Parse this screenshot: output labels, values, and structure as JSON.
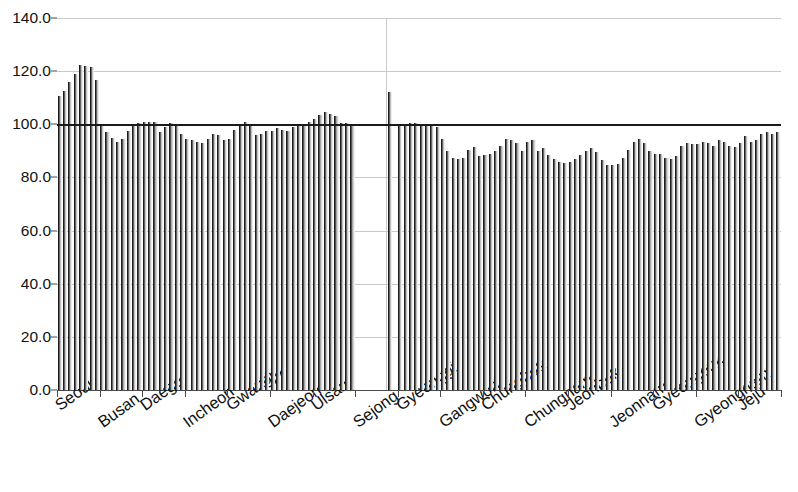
{
  "chart_data": {
    "type": "bar",
    "title": "",
    "subtitle": "",
    "xlabel": "",
    "ylabel": "",
    "ylim": [
      0.0,
      140.0
    ],
    "ytick_labels": [
      "0.0",
      "20.0",
      "40.0",
      "60.0",
      "80.0",
      "100.0",
      "120.0",
      "140.0"
    ],
    "ytick_values": [
      0.0,
      20.0,
      40.0,
      60.0,
      80.0,
      100.0,
      120.0,
      140.0
    ],
    "grid": "horizontal",
    "legend": "none",
    "reference_line": {
      "value": 100.0,
      "label": "100.0",
      "color": "#1a1a1a"
    },
    "bar_color": "#9a9a9a",
    "bar_edge_color": "#1c1c1c",
    "categories": [
      "Seoul",
      "Busan",
      "Daegu",
      "Incheon",
      "Gwangju",
      "Daejeon",
      "Ulsan",
      "Sejong",
      "Gyeonggi",
      "Gangwon",
      "Chungbuk",
      "Chungnam",
      "Jeonbuk",
      "Jeonnam",
      "Gyeongbuk",
      "Gyeongnam",
      "Jeju"
    ],
    "groups": [
      {
        "name": "Seoul",
        "values": [
          110.5,
          112.5,
          116.0,
          119.0,
          122.5,
          122.0,
          121.5,
          116.5
        ]
      },
      {
        "name": "Busan",
        "values": [
          99.5,
          97.0,
          95.0,
          93.5,
          94.5,
          97.5,
          99.5,
          100.5
        ]
      },
      {
        "name": "Daegu",
        "values": [
          101.0,
          101.0,
          101.0,
          97.0,
          99.0,
          100.5,
          99.5,
          96.5
        ]
      },
      {
        "name": "Incheon",
        "values": [
          94.5,
          94.0,
          93.5,
          93.0,
          94.5,
          96.5,
          96.0,
          94.0
        ]
      },
      {
        "name": "Gwangju",
        "values": [
          94.5,
          98.0,
          99.5,
          101.0,
          99.5,
          96.0,
          96.5,
          97.5
        ]
      },
      {
        "name": "Daejeon",
        "values": [
          97.5,
          98.5,
          98.0,
          97.5,
          99.0,
          99.5,
          100.0,
          101.0
        ]
      },
      {
        "name": "Ulsan",
        "values": [
          102.0,
          103.5,
          104.5,
          104.0,
          103.0,
          100.5,
          100.5,
          100.0
        ]
      },
      {
        "name": "Sejong",
        "values": [
          null,
          null,
          null,
          null,
          null,
          null,
          112.0,
          null
        ]
      },
      {
        "name": "Gyeonggi",
        "values": [
          99.5,
          100.0,
          100.5,
          100.5,
          100.0,
          99.5,
          99.5,
          99.0
        ]
      },
      {
        "name": "Gangwon",
        "values": [
          94.5,
          90.0,
          87.5,
          87.0,
          87.5,
          90.5,
          91.5,
          88.0
        ]
      },
      {
        "name": "Chungbuk",
        "values": [
          88.5,
          89.0,
          90.0,
          92.0,
          94.5,
          94.0,
          93.0,
          90.0
        ]
      },
      {
        "name": "Chungnam",
        "values": [
          93.5,
          94.0,
          90.0,
          91.0,
          88.5,
          87.0,
          86.0,
          85.5
        ]
      },
      {
        "name": "Jeonbuk",
        "values": [
          86.0,
          87.0,
          88.5,
          90.0,
          91.0,
          89.5,
          86.5,
          84.5
        ]
      },
      {
        "name": "Jeonnam",
        "values": [
          84.5,
          85.0,
          87.5,
          90.5,
          93.5,
          94.5,
          93.0,
          90.0
        ]
      },
      {
        "name": "Gyeongbuk",
        "values": [
          89.0,
          89.0,
          87.5,
          87.0,
          88.0,
          92.0,
          93.0,
          92.5
        ]
      },
      {
        "name": "Gyeongnam",
        "values": [
          92.5,
          93.5,
          93.0,
          92.0,
          94.0,
          93.5,
          92.0,
          91.5
        ]
      },
      {
        "name": "Jeju",
        "values": [
          93.0,
          95.5,
          93.5,
          94.0,
          96.5,
          97.0,
          96.5,
          97.0
        ]
      }
    ]
  }
}
